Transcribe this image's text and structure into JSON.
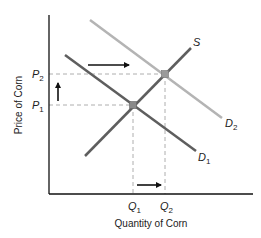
{
  "diagram": {
    "type": "supply-demand",
    "xlabel": "Quantity of Corn",
    "ylabel": "Price of Corn",
    "curves": [
      {
        "name": "S",
        "label": "S",
        "sub": "",
        "color": "#5e5e5e"
      },
      {
        "name": "D1",
        "label": "D",
        "sub": "1",
        "color": "#5e5e5e"
      },
      {
        "name": "D2",
        "label": "D",
        "sub": "2",
        "color": "#b4b4b4"
      }
    ],
    "price_ticks": [
      {
        "label": "P",
        "sub": "2"
      },
      {
        "label": "P",
        "sub": "1"
      }
    ],
    "quantity_ticks": [
      {
        "label": "Q",
        "sub": "1"
      },
      {
        "label": "Q",
        "sub": "2"
      }
    ],
    "arrows": [
      {
        "name": "demand-shift-arrow",
        "direction": "right"
      },
      {
        "name": "price-increase-arrow",
        "direction": "up"
      },
      {
        "name": "quantity-increase-arrow",
        "direction": "right"
      }
    ],
    "equilibria": [
      {
        "name": "E1",
        "price": "P1",
        "quantity": "Q1"
      },
      {
        "name": "E2",
        "price": "P2",
        "quantity": "Q2"
      }
    ]
  }
}
